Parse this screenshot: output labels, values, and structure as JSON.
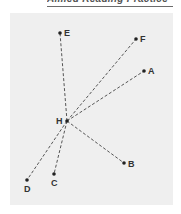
{
  "heading": {
    "text": "Aimed Reading Practice"
  },
  "diagram": {
    "background_color": "#efefef",
    "line_color": "#555555",
    "center": {
      "id": "H",
      "label": "H",
      "x": 67,
      "y": 121
    },
    "points": [
      {
        "id": "E",
        "label": "E",
        "x": 60,
        "y": 33
      },
      {
        "id": "F",
        "label": "F",
        "x": 136,
        "y": 39
      },
      {
        "id": "A",
        "label": "A",
        "x": 144,
        "y": 71
      },
      {
        "id": "B",
        "label": "B",
        "x": 124,
        "y": 163
      },
      {
        "id": "C",
        "label": "C",
        "x": 54,
        "y": 174
      },
      {
        "id": "D",
        "label": "D",
        "x": 27,
        "y": 180
      }
    ],
    "segments": [
      [
        "H",
        "E"
      ],
      [
        "H",
        "F"
      ],
      [
        "H",
        "A"
      ],
      [
        "H",
        "B"
      ],
      [
        "H",
        "C"
      ],
      [
        "H",
        "D"
      ]
    ]
  }
}
